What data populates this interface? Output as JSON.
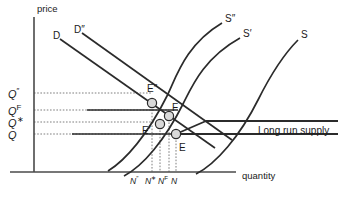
{
  "figure": {
    "type": "economics-supply-demand-diagram",
    "background_color": "#ffffff",
    "line_color": "#2b2b2b",
    "node_fill": "#d9d9d9"
  },
  "axes": {
    "y_label": "price",
    "x_label": "quantity"
  },
  "price_ticks": [
    {
      "id": "q-double-prime",
      "base": "Q",
      "sup": "″",
      "y": 93
    },
    {
      "id": "q-f",
      "base": "Q",
      "sup": "F",
      "y": 110
    },
    {
      "id": "q-star",
      "base": "Q",
      "sup": "∗",
      "y": 122
    },
    {
      "id": "q-plain",
      "base": "Q",
      "sup": "",
      "y": 134
    }
  ],
  "quantity_ticks": [
    {
      "id": "n-double-prime",
      "base": "N",
      "sup": "″",
      "x": 136
    },
    {
      "id": "n-star",
      "base": "N",
      "sup": "∗",
      "x": 151
    },
    {
      "id": "n-f",
      "base": "N",
      "sup": "F",
      "x": 164
    },
    {
      "id": "n-plain",
      "base": "N",
      "sup": "",
      "x": 176
    }
  ],
  "curves": {
    "demand": [
      {
        "id": "demand-d",
        "label": "D",
        "label_x": 53,
        "label_y": 31
      },
      {
        "id": "demand-d2",
        "label": "D″",
        "label_x": 74,
        "label_y": 25
      }
    ],
    "supply": [
      {
        "id": "supply-s2",
        "label": "S″",
        "label_x": 225,
        "label_y": 14
      },
      {
        "id": "supply-s1",
        "label": "S′",
        "label_x": 243,
        "label_y": 29
      },
      {
        "id": "supply-s",
        "label": "S",
        "label_x": 301,
        "label_y": 30
      }
    ],
    "long_run": {
      "id": "long-run-supply",
      "label": "Long run supply",
      "label_x": 258,
      "label_y": 126
    }
  },
  "equilibria": [
    {
      "id": "point-e-double-prime",
      "label": "E″",
      "cx": 152,
      "cy": 103,
      "label_x": 147,
      "label_y": 84
    },
    {
      "id": "point-f",
      "label": "F",
      "cx": 169,
      "cy": 116,
      "label_x": 172,
      "label_y": 103
    },
    {
      "id": "point-e-prime",
      "label": "E′",
      "cx": 160,
      "cy": 124,
      "label_x": 142,
      "label_y": 126
    },
    {
      "id": "point-e",
      "label": "E",
      "cx": 176,
      "cy": 134,
      "label_x": 179,
      "label_y": 143
    }
  ]
}
